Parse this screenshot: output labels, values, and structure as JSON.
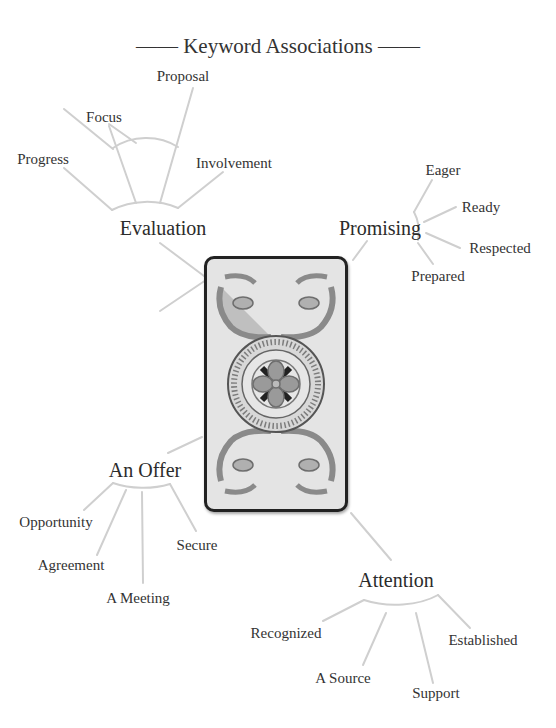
{
  "title": "—— Keyword Associations ——",
  "colors": {
    "line": "#cfcfcf",
    "text": "#333333",
    "card_border": "#222222",
    "card_bg": "#e4e4e4",
    "ornament": "#8a8a8a"
  },
  "card": {
    "icon": "ornate-card-back-icon"
  },
  "hubs": [
    {
      "label": "Evaluation",
      "keywords": [
        "Progress",
        "Focus",
        "Proposal",
        "Involvement"
      ]
    },
    {
      "label": "Promising",
      "keywords": [
        "Eager",
        "Ready",
        "Respected",
        "Prepared"
      ]
    },
    {
      "label": "An Offer",
      "keywords": [
        "Opportunity",
        "Agreement",
        "A Meeting",
        "Secure"
      ]
    },
    {
      "label": "Attention",
      "keywords": [
        "Recognized",
        "A Source",
        "Support",
        "Established"
      ]
    }
  ]
}
